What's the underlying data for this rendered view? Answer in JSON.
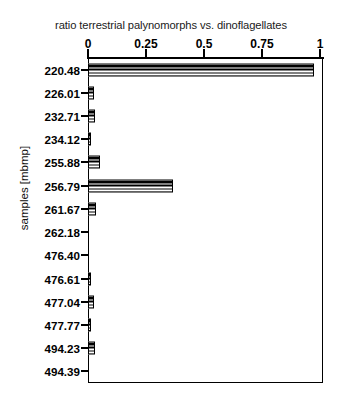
{
  "chart_data": {
    "type": "bar",
    "orientation": "horizontal",
    "title": "ratio terrestrial palynomorphs vs. dinoflagellates",
    "xlabel": "ratio terrestrial palynomorphs vs. dinoflagellates",
    "ylabel": "samples [mbmp]",
    "xlim": [
      0,
      1
    ],
    "xticks": [
      "0",
      "0.25",
      "0.5",
      "0.75",
      "1"
    ],
    "xtick_values": [
      0,
      0.25,
      0.5,
      0.75,
      1
    ],
    "grid": false,
    "legend": null,
    "axis_position": "top",
    "categories": [
      "220.48",
      "226.01",
      "232.71",
      "234.12",
      "255.88",
      "256.79",
      "261.67",
      "262.18",
      "476.40",
      "476.61",
      "477.04",
      "477.77",
      "494.23",
      "494.39"
    ],
    "values": [
      0.974,
      0.027,
      0.031,
      0.004,
      0.052,
      0.366,
      0.035,
      0.0,
      0.0,
      0.004,
      0.026,
      0.004,
      0.031,
      0.0
    ],
    "bar_fill": "horizontal-line-hatch",
    "bar_edge_color": "#000000",
    "bar_face_color": "#ffffff"
  }
}
